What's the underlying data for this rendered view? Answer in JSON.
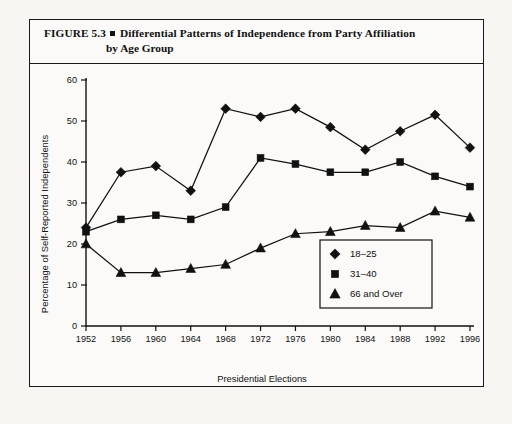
{
  "figure": {
    "label": "FIGURE 5.3",
    "bullet_icon": "square-bullet",
    "title_line1": "Differential Patterns of Independence from Party Affiliation",
    "title_line2": "by Age Group"
  },
  "chart_data": {
    "type": "line",
    "title": "Differential Patterns of Independence from Party Affiliation by Age Group",
    "xlabel": "Presidential Elections",
    "ylabel": "Percentage of Self-Reported Independents",
    "categories": [
      "1952",
      "1956",
      "1960",
      "1964",
      "1968",
      "1972",
      "1976",
      "1980",
      "1984",
      "1988",
      "1992",
      "1996"
    ],
    "xticks": [
      "1952",
      "1956",
      "1960",
      "1964",
      "1968",
      "1972",
      "1976",
      "1980",
      "1984",
      "1988",
      "1992",
      "1996"
    ],
    "yticks": [
      0,
      10,
      20,
      30,
      40,
      50,
      60
    ],
    "ylim": [
      0,
      60
    ],
    "grid": false,
    "legend_position": "inside-lower-right",
    "series": [
      {
        "name": "18–25",
        "marker": "diamond",
        "color": "#111111",
        "values": [
          24,
          37.5,
          39,
          33,
          53,
          51,
          53,
          48.5,
          43,
          47.5,
          51.5,
          43.5
        ]
      },
      {
        "name": "31–40",
        "marker": "square",
        "color": "#111111",
        "values": [
          23,
          26,
          27,
          26,
          29,
          41,
          39.5,
          37.5,
          37.5,
          40,
          36.5,
          34
        ]
      },
      {
        "name": "66 and Over",
        "marker": "triangle",
        "color": "#111111",
        "values": [
          20,
          13,
          13,
          14,
          15,
          19,
          22.5,
          23,
          24.5,
          24,
          28,
          26.5
        ]
      }
    ]
  }
}
